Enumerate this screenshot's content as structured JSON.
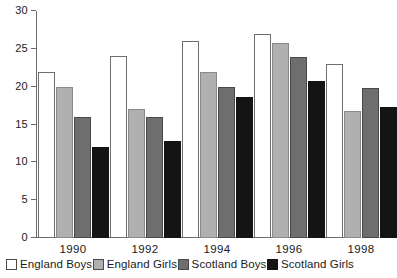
{
  "chart_data": {
    "type": "bar",
    "title": "",
    "xlabel": "",
    "ylabel": "",
    "categories": [
      "1990",
      "1992",
      "1994",
      "1996",
      "1998"
    ],
    "ylim": [
      0,
      30
    ],
    "yticks": [
      0,
      5,
      10,
      15,
      20,
      25,
      30
    ],
    "grid": false,
    "legend_position": "bottom",
    "series": [
      {
        "name": "England Boys",
        "color": "#ffffff",
        "values": [
          22.0,
          24.0,
          26.0,
          26.9,
          23.0
        ]
      },
      {
        "name": "England Girls",
        "color": "#b0b0b0",
        "values": [
          20.0,
          17.0,
          22.0,
          25.8,
          16.8
        ]
      },
      {
        "name": "Scotland Boys",
        "color": "#6e6e6e",
        "values": [
          16.0,
          16.0,
          20.0,
          23.9,
          19.8
        ]
      },
      {
        "name": "Scotland Girls",
        "color": "#141414",
        "values": [
          12.0,
          12.8,
          18.6,
          20.8,
          17.3
        ]
      }
    ]
  }
}
